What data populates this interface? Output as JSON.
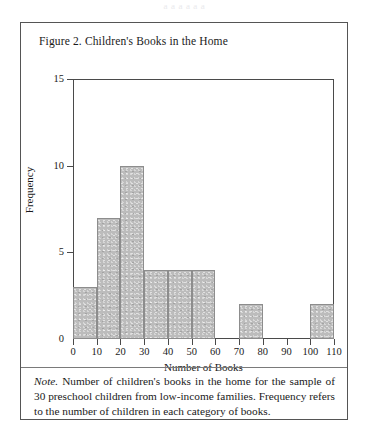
{
  "ghost_header": "a a   a  a a  a",
  "figure": {
    "title": "Figure 2.  Children's Books in the Home",
    "note_label": "Note.",
    "note_text": "Number of children's books in the home for the sample of 30 preschool children from low-income families.  Frequency refers to the number of children in each category of books."
  },
  "chart_data": {
    "type": "bar",
    "title": "Figure 2.  Children's Books in the Home",
    "xlabel": "Number of Books",
    "ylabel": "Frequency",
    "xlim": [
      0,
      110
    ],
    "ylim": [
      0,
      15
    ],
    "grid": false,
    "legend": null,
    "histogram": true,
    "xticks": [
      0,
      10,
      20,
      30,
      40,
      50,
      60,
      70,
      80,
      90,
      100,
      110
    ],
    "yticks": [
      0,
      5,
      10,
      15
    ],
    "xtick_labels": [
      "0",
      "10",
      "20",
      "30",
      "40",
      "50",
      "60",
      "70",
      "80",
      "90",
      "100",
      "110"
    ],
    "ytick_labels": [
      "0",
      "5",
      "10",
      "15"
    ],
    "bins": [
      {
        "start": 0,
        "end": 10,
        "value": 3
      },
      {
        "start": 10,
        "end": 20,
        "value": 7
      },
      {
        "start": 20,
        "end": 30,
        "value": 10
      },
      {
        "start": 30,
        "end": 40,
        "value": 4
      },
      {
        "start": 40,
        "end": 50,
        "value": 4
      },
      {
        "start": 50,
        "end": 60,
        "value": 4
      },
      {
        "start": 70,
        "end": 80,
        "value": 2
      },
      {
        "start": 100,
        "end": 110,
        "value": 2
      }
    ],
    "categories": [
      "0-10",
      "10-20",
      "20-30",
      "30-40",
      "40-50",
      "50-60",
      "70-80",
      "100-110"
    ],
    "values": [
      3,
      7,
      10,
      4,
      4,
      4,
      2,
      2
    ],
    "total_n": 30
  },
  "colors": {
    "bar_fill": "#bcbcbc",
    "bar_stroke": "#8d8d8d",
    "axis": "#4a4a4a",
    "frame": "#555555",
    "text": "#1a1a1a",
    "page": "#ffffff"
  }
}
